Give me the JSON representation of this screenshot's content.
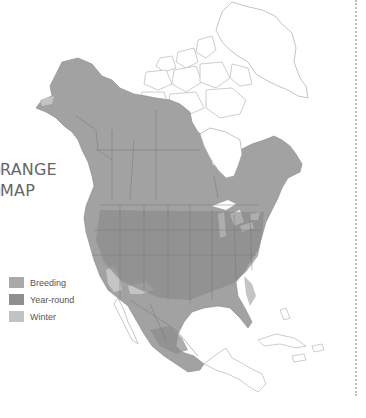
{
  "title": {
    "line1": "RANGE",
    "line2": "MAP"
  },
  "legend": {
    "items": [
      {
        "label": "Breeding",
        "color": "#a9a9a9"
      },
      {
        "label": "Year-round",
        "color": "#8f8f8f"
      },
      {
        "label": "Winter",
        "color": "#c2c2c2"
      }
    ]
  },
  "colors": {
    "year_round": "#8f8f8f",
    "breeding": "#a9a9a9",
    "winter": "#c2c2c2",
    "outline": "#b5b5b5",
    "border": "#6f6f6f"
  }
}
